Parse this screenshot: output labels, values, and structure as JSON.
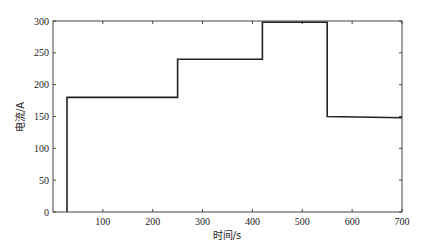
{
  "chart_data": {
    "type": "line",
    "style": "step",
    "title": "",
    "xlabel": "时间/s",
    "ylabel": "电流/A",
    "xlim": [
      0,
      700
    ],
    "ylim": [
      0,
      300
    ],
    "x_ticks": [
      100,
      200,
      300,
      400,
      500,
      600,
      700
    ],
    "y_ticks": [
      0,
      50,
      100,
      150,
      200,
      250,
      300
    ],
    "grid": false,
    "legend": null,
    "series": [
      {
        "name": "current",
        "color": "#222222",
        "points": [
          [
            28,
            0
          ],
          [
            28,
            180
          ],
          [
            250,
            180
          ],
          [
            250,
            240
          ],
          [
            420,
            240
          ],
          [
            420,
            298
          ],
          [
            550,
            298
          ],
          [
            550,
            150
          ],
          [
            700,
            148
          ]
        ]
      }
    ]
  }
}
